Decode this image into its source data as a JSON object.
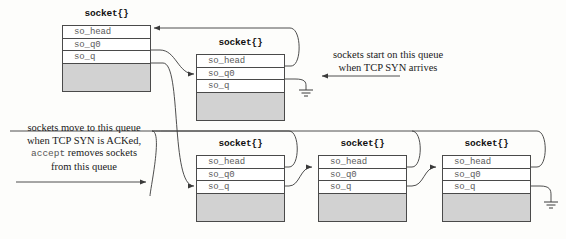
{
  "diagram": {
    "struct_label": "socket{}",
    "fields": [
      "so_head",
      "so_q0",
      "so_q"
    ],
    "colors": {
      "box_border": "#4a4a4a",
      "box_fill": "#ffffff",
      "block_fill": "#d2d2d2",
      "field_text": "#5a5a5a",
      "line": "#3a3a3a",
      "note_text": "#1a1a1a",
      "background": "#fdfdfb"
    }
  },
  "sockets": [
    {
      "id": "listening-socket",
      "label": "socket{}",
      "fields": [
        "so_head",
        "so_q0",
        "so_q"
      ],
      "x": 62,
      "y": 25,
      "w": 89,
      "title_y": 8
    },
    {
      "id": "incomplete-queue-socket-1",
      "label": "socket{}",
      "fields": [
        "so_head",
        "so_q0",
        "so_q"
      ],
      "x": 196,
      "y": 54,
      "w": 89,
      "title_y": 37
    },
    {
      "id": "completed-queue-socket-1",
      "label": "socket{}",
      "fields": [
        "so_head",
        "so_q0",
        "so_q"
      ],
      "x": 196,
      "y": 155,
      "w": 89,
      "title_y": 138
    },
    {
      "id": "completed-queue-socket-2",
      "label": "socket{}",
      "fields": [
        "so_head",
        "so_q0",
        "so_q"
      ],
      "x": 318,
      "y": 155,
      "w": 89,
      "title_y": 138
    },
    {
      "id": "completed-queue-socket-3",
      "label": "socket{}",
      "fields": [
        "so_head",
        "so_q0",
        "so_q"
      ],
      "x": 442,
      "y": 155,
      "w": 89,
      "title_y": 138
    }
  ],
  "annotations": {
    "incomplete_queue": {
      "id": "incomplete-queue-note",
      "lines": [
        "sockets start on this queue",
        "when TCP SYN arrives"
      ],
      "x": 312,
      "y": 49,
      "align": "ta-c",
      "w": 150
    },
    "completed_queue": {
      "id": "completed-queue-note",
      "line1": "sockets move to this queue",
      "line2": "when TCP SYN is ACKed,",
      "line3_mono": "accept",
      "line3_rest": " removes sockets",
      "line4": "from this queue",
      "x": 10,
      "y": 122,
      "w": 152
    }
  }
}
